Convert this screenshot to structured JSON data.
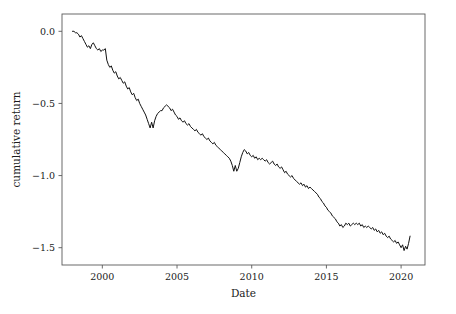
{
  "figure": {
    "background_color": "#ffffff",
    "line_color": "#111111",
    "axis_color": "#5a5a5a",
    "text_color": "#1a1a1a"
  },
  "axes": {
    "x_title": "Date",
    "y_title": "cumulative return",
    "x_tick_labels": [
      "2000",
      "2005",
      "2010",
      "2015",
      "2020"
    ],
    "y_tick_labels": [
      "0.0",
      "−0.5",
      "−1.0",
      "−1.5"
    ]
  },
  "chart_data": {
    "type": "line",
    "title": "",
    "xlabel": "Date",
    "ylabel": "cumulative return",
    "xlim": [
      1997.3,
      2021.6
    ],
    "ylim": [
      -1.62,
      0.12
    ],
    "xticks": [
      2000,
      2005,
      2010,
      2015,
      2020
    ],
    "yticks": [
      0.0,
      -0.5,
      -1.0,
      -1.5
    ],
    "grid": false,
    "legend": null,
    "legend_position": "none",
    "series": [
      {
        "name": "cumulative return",
        "color": "#111111",
        "x": [
          1998.0,
          1998.1,
          1998.2,
          1998.3,
          1998.4,
          1998.5,
          1998.6,
          1998.7,
          1998.8,
          1998.9,
          1999.0,
          1999.1,
          1999.2,
          1999.3,
          1999.4,
          1999.5,
          1999.6,
          1999.7,
          1999.8,
          1999.9,
          2000.0,
          2000.1,
          2000.2,
          2000.3,
          2000.4,
          2000.5,
          2000.6,
          2000.7,
          2000.8,
          2000.9,
          2001.0,
          2001.1,
          2001.2,
          2001.3,
          2001.4,
          2001.5,
          2001.6,
          2001.7,
          2001.8,
          2001.9,
          2002.0,
          2002.1,
          2002.2,
          2002.3,
          2002.4,
          2002.5,
          2002.6,
          2002.7,
          2002.8,
          2002.9,
          2003.0,
          2003.1,
          2003.2,
          2003.3,
          2003.4,
          2003.5,
          2003.6,
          2003.7,
          2003.8,
          2003.9,
          2004.0,
          2004.1,
          2004.2,
          2004.3,
          2004.4,
          2004.5,
          2004.6,
          2004.7,
          2004.8,
          2004.9,
          2005.0,
          2005.1,
          2005.2,
          2005.3,
          2005.4,
          2005.5,
          2005.6,
          2005.7,
          2005.8,
          2005.9,
          2006.0,
          2006.1,
          2006.2,
          2006.3,
          2006.4,
          2006.5,
          2006.6,
          2006.7,
          2006.8,
          2006.9,
          2007.0,
          2007.1,
          2007.2,
          2007.3,
          2007.4,
          2007.5,
          2007.6,
          2007.7,
          2007.8,
          2007.9,
          2008.0,
          2008.1,
          2008.2,
          2008.3,
          2008.4,
          2008.5,
          2008.6,
          2008.7,
          2008.8,
          2008.9,
          2009.0,
          2009.1,
          2009.2,
          2009.3,
          2009.4,
          2009.5,
          2009.6,
          2009.7,
          2009.8,
          2009.9,
          2010.0,
          2010.1,
          2010.2,
          2010.3,
          2010.4,
          2010.5,
          2010.6,
          2010.7,
          2010.8,
          2010.9,
          2011.0,
          2011.1,
          2011.2,
          2011.3,
          2011.4,
          2011.5,
          2011.6,
          2011.7,
          2011.8,
          2011.9,
          2012.0,
          2012.1,
          2012.2,
          2012.3,
          2012.4,
          2012.5,
          2012.6,
          2012.7,
          2012.8,
          2012.9,
          2013.0,
          2013.1,
          2013.2,
          2013.3,
          2013.4,
          2013.5,
          2013.6,
          2013.7,
          2013.8,
          2013.9,
          2014.0,
          2014.1,
          2014.2,
          2014.3,
          2014.4,
          2014.5,
          2014.6,
          2014.7,
          2014.8,
          2014.9,
          2015.0,
          2015.1,
          2015.2,
          2015.3,
          2015.4,
          2015.5,
          2015.6,
          2015.7,
          2015.8,
          2015.9,
          2016.0,
          2016.1,
          2016.2,
          2016.3,
          2016.4,
          2016.5,
          2016.6,
          2016.7,
          2016.8,
          2016.9,
          2017.0,
          2017.1,
          2017.2,
          2017.3,
          2017.4,
          2017.5,
          2017.6,
          2017.7,
          2017.8,
          2017.9,
          2018.0,
          2018.1,
          2018.2,
          2018.3,
          2018.4,
          2018.5,
          2018.6,
          2018.7,
          2018.8,
          2018.9,
          2019.0,
          2019.1,
          2019.2,
          2019.3,
          2019.4,
          2019.5,
          2019.6,
          2019.7,
          2019.8,
          2019.9,
          2020.0,
          2020.1,
          2020.2,
          2020.3,
          2020.4,
          2020.5,
          2020.6
        ],
        "y": [
          0.0,
          0.0,
          -0.01,
          -0.01,
          -0.02,
          -0.04,
          -0.03,
          -0.05,
          -0.07,
          -0.09,
          -0.11,
          -0.1,
          -0.12,
          -0.09,
          -0.08,
          -0.1,
          -0.12,
          -0.13,
          -0.12,
          -0.14,
          -0.13,
          -0.13,
          -0.12,
          -0.2,
          -0.23,
          -0.25,
          -0.24,
          -0.27,
          -0.29,
          -0.28,
          -0.31,
          -0.33,
          -0.32,
          -0.34,
          -0.36,
          -0.35,
          -0.38,
          -0.4,
          -0.39,
          -0.42,
          -0.44,
          -0.43,
          -0.46,
          -0.48,
          -0.47,
          -0.5,
          -0.52,
          -0.54,
          -0.56,
          -0.58,
          -0.61,
          -0.64,
          -0.67,
          -0.63,
          -0.67,
          -0.62,
          -0.59,
          -0.57,
          -0.56,
          -0.55,
          -0.55,
          -0.53,
          -0.52,
          -0.51,
          -0.52,
          -0.53,
          -0.55,
          -0.54,
          -0.56,
          -0.58,
          -0.59,
          -0.61,
          -0.6,
          -0.62,
          -0.63,
          -0.62,
          -0.64,
          -0.65,
          -0.64,
          -0.66,
          -0.67,
          -0.68,
          -0.69,
          -0.68,
          -0.7,
          -0.71,
          -0.72,
          -0.71,
          -0.73,
          -0.74,
          -0.75,
          -0.74,
          -0.76,
          -0.77,
          -0.78,
          -0.77,
          -0.79,
          -0.8,
          -0.81,
          -0.82,
          -0.83,
          -0.84,
          -0.85,
          -0.86,
          -0.87,
          -0.88,
          -0.9,
          -0.93,
          -0.97,
          -0.93,
          -0.97,
          -0.95,
          -0.91,
          -0.87,
          -0.84,
          -0.82,
          -0.83,
          -0.85,
          -0.84,
          -0.86,
          -0.87,
          -0.86,
          -0.88,
          -0.87,
          -0.89,
          -0.88,
          -0.89,
          -0.88,
          -0.89,
          -0.9,
          -0.89,
          -0.91,
          -0.92,
          -0.91,
          -0.9,
          -0.92,
          -0.93,
          -0.92,
          -0.94,
          -0.95,
          -0.94,
          -0.96,
          -0.98,
          -0.97,
          -0.99,
          -1.0,
          -1.01,
          -1.0,
          -1.02,
          -1.03,
          -1.04,
          -1.05,
          -1.06,
          -1.05,
          -1.07,
          -1.06,
          -1.08,
          -1.07,
          -1.09,
          -1.08,
          -1.09,
          -1.1,
          -1.11,
          -1.12,
          -1.13,
          -1.15,
          -1.16,
          -1.18,
          -1.19,
          -1.21,
          -1.22,
          -1.24,
          -1.25,
          -1.26,
          -1.28,
          -1.29,
          -1.3,
          -1.32,
          -1.33,
          -1.35,
          -1.34,
          -1.36,
          -1.35,
          -1.33,
          -1.34,
          -1.33,
          -1.35,
          -1.34,
          -1.33,
          -1.34,
          -1.33,
          -1.34,
          -1.33,
          -1.35,
          -1.34,
          -1.36,
          -1.35,
          -1.36,
          -1.35,
          -1.36,
          -1.37,
          -1.36,
          -1.38,
          -1.37,
          -1.39,
          -1.38,
          -1.4,
          -1.39,
          -1.41,
          -1.4,
          -1.42,
          -1.43,
          -1.42,
          -1.44,
          -1.45,
          -1.46,
          -1.45,
          -1.47,
          -1.46,
          -1.48,
          -1.5,
          -1.48,
          -1.52,
          -1.49,
          -1.51,
          -1.47,
          -1.42
        ]
      }
    ]
  }
}
